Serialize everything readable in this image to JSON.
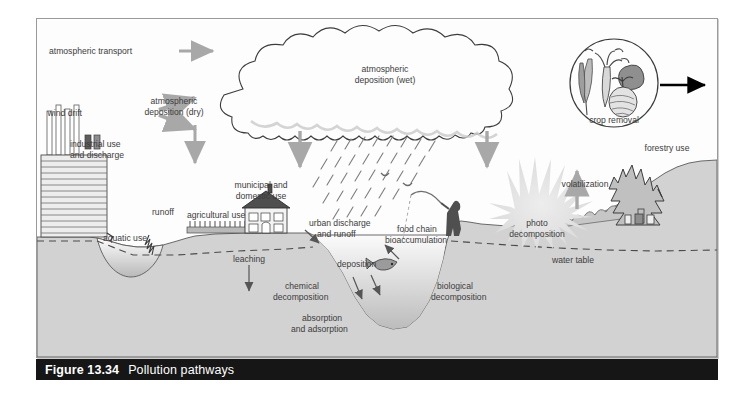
{
  "figure": {
    "number": "Figure 13.34",
    "title": "Pollution pathways"
  },
  "diagram": {
    "type": "process-cycle-illustration",
    "labels": {
      "atmospheric_transport": "atmospheric transport",
      "wind_drift": "wind drift",
      "atmospheric_deposition_dry": "atmospheric\ndeposition (dry)",
      "atmospheric_deposition_dry_l1": "atmospheric",
      "atmospheric_deposition_dry_l2": "deposition (dry)",
      "atmospheric_deposition_wet_l1": "atmospheric",
      "atmospheric_deposition_wet_l2": "deposition (wet)",
      "crop_removal": "crop removal",
      "industrial_use_l1": "industrial use",
      "industrial_use_l2": "and discharge",
      "aquatic_use": "aquatic use",
      "runoff": "runoff",
      "agricultural_use": "agricultural use",
      "municipal_use_l1": "municipal and",
      "municipal_use_l2": "domestic use",
      "urban_discharge_l1": "urban discharge",
      "urban_discharge_l2": "and runoff",
      "leaching": "leaching",
      "chemical_decomposition_l1": "chemical",
      "chemical_decomposition_l2": "decomposition",
      "absorption_l1": "absorption",
      "absorption_l2": "and adsorption",
      "deposition": "deposition",
      "food_chain_l1": "food chain",
      "food_chain_l2": "bioaccumulation",
      "biological_decomposition_l1": "biological",
      "biological_decomposition_l2": "decomposition",
      "photo_decomposition_l1": "photo",
      "photo_decomposition_l2": "decomposition",
      "water_table": "water table",
      "volatilization": "volatilization",
      "forestry_use": "forestry use"
    },
    "icons": [
      "cloud-icon",
      "rain-icon",
      "sun-burst-icon",
      "factory-icon",
      "house-icon",
      "crop-row-icon",
      "fisherman-icon",
      "fish-icon",
      "bird-icon",
      "conifer-tree-icon",
      "shrub-icon",
      "vegetables-icon",
      "arrow-icon"
    ],
    "colors": {
      "ground_fill": "#d2d2d2",
      "water_fill": "#e8e8e8",
      "arrow_gray": "#a8a8a8",
      "arrow_black": "#000000",
      "outline": "#4a4a4a",
      "text": "#3c3c3c",
      "caption_bar": "#161616",
      "caption_text": "#ffffff",
      "frame_border": "#9a9a9a",
      "sunburst": "#e2e2e2",
      "dark_structure": "#4f4f4f"
    }
  }
}
